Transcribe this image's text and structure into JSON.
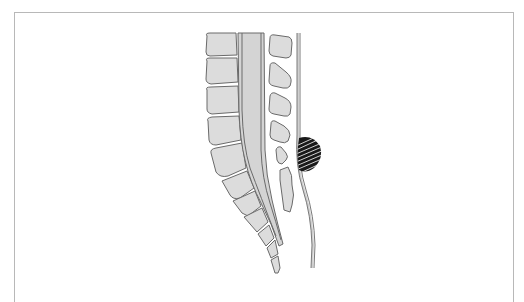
{
  "figure": {
    "type": "anatomical-illustration",
    "colors": {
      "bone_fill": "#dcdcdc",
      "outline": "#6a6a6a",
      "frame_border": "#b8b8b8",
      "mass": "#1a1a1a",
      "background": "#ffffff"
    },
    "elements": {
      "vertebral_bodies": 5,
      "spinous_processes": 4,
      "sacrum": true,
      "coccyx": true,
      "spinal_canal": true,
      "skin_line": true,
      "hatched_mass": true
    }
  }
}
